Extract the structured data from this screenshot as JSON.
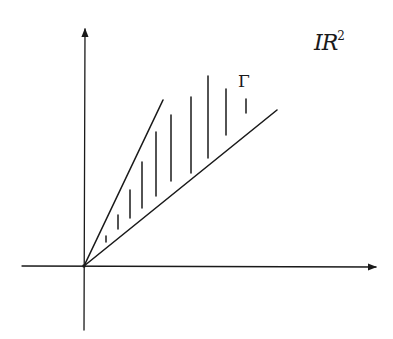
{
  "diagram": {
    "space_label": "IR",
    "space_exponent": "2",
    "cone_label": "Γ",
    "colors": {
      "stroke": "#1a1a1a",
      "background": "#ffffff"
    },
    "origin": [
      84,
      266
    ],
    "axes": {
      "x": {
        "from": [
          22,
          266
        ],
        "to": [
          378,
          267
        ]
      },
      "y": {
        "from": [
          84,
          330
        ],
        "to": [
          85,
          27
        ]
      }
    },
    "rays": {
      "upper": {
        "from": [
          84,
          266
        ],
        "to": [
          163,
          100
        ]
      },
      "lower": {
        "from": [
          84,
          266
        ],
        "to": [
          277,
          110
        ]
      }
    },
    "hatch_lines": [
      {
        "x": 106,
        "y1": 236,
        "y2": 242
      },
      {
        "x": 118,
        "y1": 215,
        "y2": 229
      },
      {
        "x": 130,
        "y1": 190,
        "y2": 218
      },
      {
        "x": 142,
        "y1": 162,
        "y2": 208
      },
      {
        "x": 156,
        "y1": 132,
        "y2": 196
      },
      {
        "x": 171,
        "y1": 115,
        "y2": 181
      },
      {
        "x": 191,
        "y1": 97,
        "y2": 173
      },
      {
        "x": 208,
        "y1": 76,
        "y2": 158
      },
      {
        "x": 226,
        "y1": 89,
        "y2": 135
      },
      {
        "x": 246,
        "y1": 99,
        "y2": 113
      }
    ]
  }
}
